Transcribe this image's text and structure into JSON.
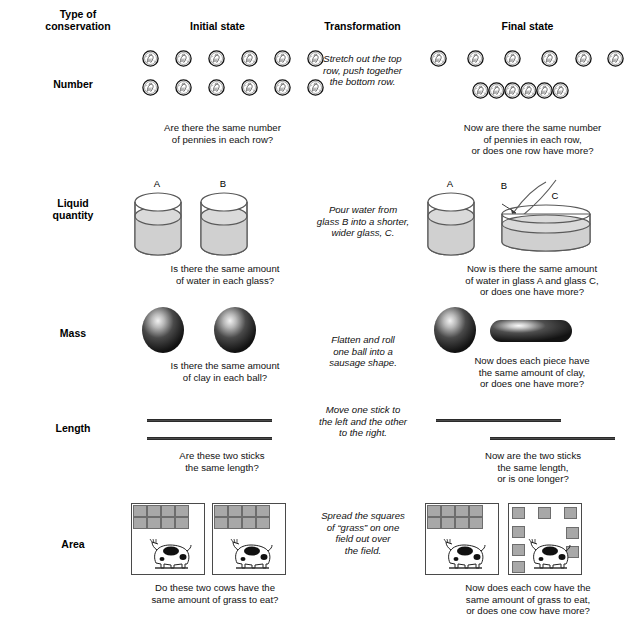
{
  "figure": {
    "headers": {
      "col1": "Type of\nconservation",
      "col1_line1": "Type of",
      "col1_line2": "conservation",
      "col2": "Initial state",
      "col3": "Transformation",
      "col4": "Final state"
    },
    "rows": [
      {
        "id": "number",
        "label": "Number",
        "label_line1": "Number",
        "label_line2": "",
        "initial_caption_line1": "Are there the same number",
        "initial_caption_line2": "of pennies in each row?",
        "initial_caption_line3": "",
        "transformation_line1": "Stretch out the top",
        "transformation_line2": "row, push together",
        "transformation_line3": "the bottom row.",
        "final_caption_line1": "Now are there the same number",
        "final_caption_line2": "of pennies in each row,",
        "final_caption_line3": "or does one row have more?",
        "initial_top_row_count": 6,
        "initial_bottom_row_count": 6,
        "final_top_row_count": 6,
        "final_bottom_row_count": 6
      },
      {
        "id": "liquid-quantity",
        "label": "Liquid quantity",
        "label_line1": "Liquid",
        "label_line2": "quantity",
        "initial_caption_line1": "Is there the same amount",
        "initial_caption_line2": "of water in each glass?",
        "initial_caption_line3": "",
        "transformation_line1": "Pour water from",
        "transformation_line2": "glass B into a shorter,",
        "transformation_line3": "wider glass, C.",
        "final_caption_line1": "Now is there the same amount",
        "final_caption_line2": "of water in glass A and glass C,",
        "final_caption_line3": "or does one have more?",
        "glass_a_label": "A",
        "glass_b_label": "B",
        "glass_c_label": "C"
      },
      {
        "id": "mass",
        "label": "Mass",
        "label_line1": "Mass",
        "label_line2": "",
        "initial_caption_line1": "Is there the same amount",
        "initial_caption_line2": "of clay in each ball?",
        "initial_caption_line3": "",
        "transformation_line1": "Flatten and roll",
        "transformation_line2": "one ball into a",
        "transformation_line3": "sausage shape.",
        "final_caption_line1": "Now does each piece have",
        "final_caption_line2": "the same amount of clay,",
        "final_caption_line3": "or does one have more?"
      },
      {
        "id": "length",
        "label": "Length",
        "label_line1": "Length",
        "label_line2": "",
        "initial_caption_line1": "Are these two sticks",
        "initial_caption_line2": "the same length?",
        "initial_caption_line3": "",
        "transformation_line1": "Move one stick to",
        "transformation_line2": "the left and the other",
        "transformation_line3": "to the right.",
        "final_caption_line1": "Now are the two sticks",
        "final_caption_line2": "the same length,",
        "final_caption_line3": "or is one longer?"
      },
      {
        "id": "area",
        "label": "Area",
        "label_line1": "Area",
        "label_line2": "",
        "initial_caption_line1": "Do these two cows have the",
        "initial_caption_line2": "same amount of grass to eat?",
        "initial_caption_line3": "",
        "transformation_line1": "Spread the squares",
        "transformation_line2": "of “grass” on one",
        "transformation_line3": "field out over",
        "transformation_line4": "the field.",
        "final_caption_line1": "Now does each cow have the",
        "final_caption_line2": "same amount of grass to eat,",
        "final_caption_line3": "or does one cow have more?",
        "grass_square_count": 8
      }
    ],
    "colors": {
      "ink": "#000000",
      "line": "#4a4a4a",
      "water_fill": "#cfcfcf",
      "grass_square": "#a8a8a8",
      "grass_square_border": "#6d6d6d",
      "clay_dark": "#2b2b2b",
      "stick": "#4a4a4a"
    }
  }
}
